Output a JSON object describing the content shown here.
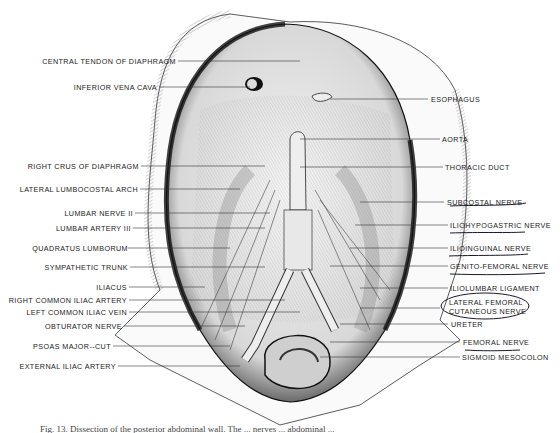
{
  "figure": {
    "caption": "Fig. 13. Dissection of the posterior abdominal wall. The ... nerves ... abdominal ...",
    "labels_left": [
      {
        "text": "CENTRAL TENDON OF DIAPHRAGM",
        "y": 61
      },
      {
        "text": "INFERIOR VENA CAVA",
        "y": 87
      },
      {
        "text": "RIGHT CRUS OF DIAPHRAGM",
        "y": 166
      },
      {
        "text": "LATERAL LUMBOCOSTAL ARCH",
        "y": 189
      },
      {
        "text": "LUMBAR NERVE II",
        "y": 213
      },
      {
        "text": "LUMBAR ARTERY III",
        "y": 228
      },
      {
        "text": "QUADRATUS LUMBORUM",
        "y": 248
      },
      {
        "text": "SYMPATHETIC TRUNK",
        "y": 267
      },
      {
        "text": "ILIACUS",
        "y": 287
      },
      {
        "text": "RIGHT COMMON ILIAC ARTERY",
        "y": 300
      },
      {
        "text": "LEFT COMMON ILIAC VEIN",
        "y": 312
      },
      {
        "text": "OBTURATOR NERVE",
        "y": 326
      },
      {
        "text": "PSOAS MAJOR--CUT",
        "y": 346
      },
      {
        "text": "EXTERNAL ILIAC ARTERY",
        "y": 366
      }
    ],
    "labels_right": [
      {
        "text": "ESOPHAGUS",
        "y": 99
      },
      {
        "text": "AORTA",
        "y": 139
      },
      {
        "text": "THORACIC DUCT",
        "y": 167
      },
      {
        "text": "SUBCOSTAL NERVE",
        "y": 202
      },
      {
        "text": "ILIOHYPOGASTRIC NERVE",
        "y": 225
      },
      {
        "text": "ILIOINGUINAL NERVE",
        "y": 248
      },
      {
        "text": "GENITO-FEMORAL NERVE",
        "y": 266
      },
      {
        "text": "ILIOLUMBAR LIGAMENT",
        "y": 288
      },
      {
        "text": "LATERAL FEMORAL",
        "y": 302
      },
      {
        "text": "CUTANEOUS NERVE",
        "y": 311
      },
      {
        "text": "URETER",
        "y": 324
      },
      {
        "text": "FEMORAL NERVE",
        "y": 342
      },
      {
        "text": "SIGMOID MESOCOLON",
        "y": 357
      }
    ],
    "colors": {
      "ink": "#222222",
      "background": "#ffffff",
      "annotation_pen": "#1a1a2e"
    }
  }
}
